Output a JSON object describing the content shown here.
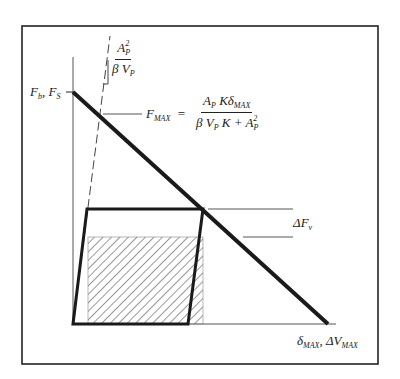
{
  "diagram": {
    "type": "force-displacement",
    "labels": {
      "y_intercept": "F_b , F_S",
      "y_intercept_main": "F",
      "y_intercept_sub1": "b",
      "y_intercept_sep": ", ",
      "y_intercept_main2": "F",
      "y_intercept_sub2": "S",
      "slope_num_main": "A",
      "slope_num_sub": "P",
      "slope_num_sup": "2",
      "slope_den": "β V",
      "slope_den_sub": "P",
      "fmax_lhs": "F",
      "fmax_lhs_sub": "MAX",
      "fmax_eq": "=",
      "fmax_num_a": "A",
      "fmax_num_a_sub": "P",
      "fmax_num_k": " Kδ",
      "fmax_num_sub": "MAX",
      "fmax_den_b": "β V",
      "fmax_den_sub": "P",
      "fmax_den_rest": " K + A",
      "fmax_den_a_sub": "P",
      "fmax_den_sup": "2",
      "delta_fv": "ΔF",
      "delta_fv_sub": "v",
      "x_intercept_a": "δ",
      "x_intercept_a_sub": "MAX",
      "x_intercept_sep": ", ΔV",
      "x_intercept_b_sub": "MAX"
    },
    "colors": {
      "line": "#1a1a1a",
      "thin": "#555555",
      "frame": "#222222"
    }
  }
}
